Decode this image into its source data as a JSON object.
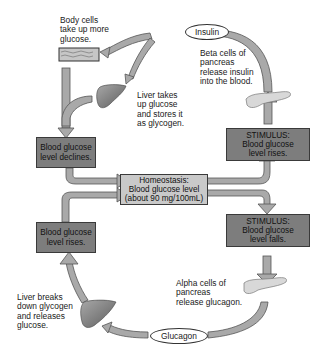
{
  "diagram": {
    "type": "feedback-loop",
    "topic": "Blood glucose homeostasis",
    "center": {
      "title": "Homeostasis:",
      "line2": "Blood glucose level",
      "line3": "(about 90 mg/100mL)"
    },
    "high_branch": {
      "stimulus_title": "STIMULUS:",
      "stimulus_line2": "Blood glucose",
      "stimulus_line3": "level rises.",
      "pancreas_text": [
        "Beta cells of",
        "pancreas",
        "release insulin",
        "into the blood."
      ],
      "hormone": "Insulin",
      "body_cells_text": [
        "Body cells",
        "take up more",
        "glucose."
      ],
      "liver_text": [
        "Liver takes",
        "up glucose",
        "and stores it",
        "as glycogen."
      ],
      "result_line1": "Blood glucose",
      "result_line2": "level declines."
    },
    "low_branch": {
      "stimulus_title": "STIMULUS:",
      "stimulus_line2": "Blood glucose",
      "stimulus_line3": "level falls.",
      "pancreas_text": [
        "Alpha cells of",
        "pancreas",
        "release glucagon."
      ],
      "hormone": "Glucagon",
      "liver_text": [
        "Liver breaks",
        "down glycogen",
        "and releases",
        "glucose."
      ],
      "result_line1": "Blood glucose",
      "result_line2": "level rises."
    },
    "colors": {
      "box_dark": "#7d7d7d",
      "box_light": "#c9c9c9",
      "arrow": "#a9a9a9",
      "liver": "#8a8a8a",
      "pancreas": "#d8d8d8"
    }
  }
}
